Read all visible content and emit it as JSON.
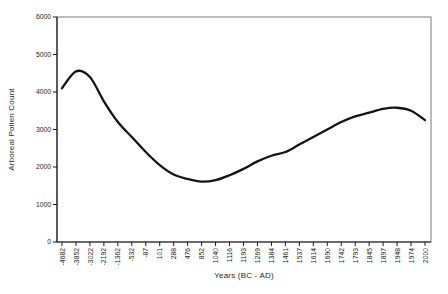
{
  "page": {
    "background_color": "#ffffff"
  },
  "chart_data": {
    "type": "line",
    "title": "",
    "xlabel": "Years (BC - AD)",
    "ylabel": "Arboreal Pollen Count",
    "ylim": [
      0,
      6000
    ],
    "ytick_interval": 1000,
    "yticks": [
      0,
      1000,
      2000,
      3000,
      4000,
      5000,
      6000
    ],
    "categories": [
      -4682,
      -3852,
      -3022,
      -2192,
      -1362,
      -532,
      -87,
      101,
      288,
      476,
      852,
      1040,
      1116,
      1193,
      1269,
      1384,
      1461,
      1537,
      1614,
      1690,
      1742,
      1793,
      1845,
      1897,
      1948,
      1974,
      2000
    ],
    "series": [
      {
        "name": "Arboreal Pollen Count",
        "values": [
          4100,
          4550,
          4400,
          3750,
          3200,
          2800,
          2400,
          2050,
          1800,
          1680,
          1610,
          1650,
          1780,
          1950,
          2150,
          2300,
          2400,
          2600,
          2800,
          3000,
          3200,
          3350,
          3450,
          3550,
          3580,
          3500,
          3250
        ]
      }
    ],
    "grid": false,
    "legend_position": "none",
    "smooth": true,
    "line_color": "#141414",
    "line_width": 2.3,
    "plot_border_color": "#7a7a7a",
    "axis_color": "#1a1a1a",
    "tick_color": "#1a1a1a",
    "text_color": "#1f1f1f"
  }
}
